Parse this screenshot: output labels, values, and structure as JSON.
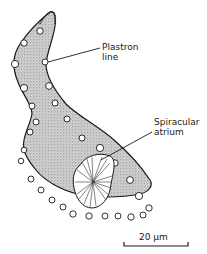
{
  "figure": {
    "type": "scientific-diagram",
    "labels": {
      "plastron_line_1": "Plastron",
      "plastron_line_2": "line",
      "spiracular_atrium_1": "Spiracular",
      "spiracular_atrium_2": "atrium"
    },
    "scale_bar": {
      "label": "20 µm",
      "value": 20,
      "unit": "µm"
    },
    "colors": {
      "ink": "#1a1a1a",
      "stipple_fill": "#c8c8c8",
      "background": "#ffffff"
    }
  }
}
